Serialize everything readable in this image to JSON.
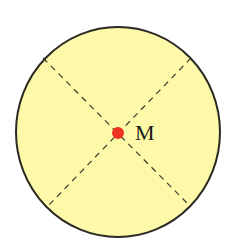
{
  "diagram": {
    "circle": {
      "cx": 118,
      "cy": 132,
      "r": 103,
      "fill": "#fdf9a8",
      "stroke": "#2a2a22"
    },
    "point": {
      "label": "M",
      "cx": 118,
      "cy": 133,
      "r": 6,
      "color": "#ee3322"
    },
    "dashed_chords": [
      {
        "x1": 43,
        "y1": 58,
        "x2": 190,
        "y2": 206
      },
      {
        "x1": 191,
        "y1": 58,
        "x2": 48,
        "y2": 206
      }
    ]
  }
}
